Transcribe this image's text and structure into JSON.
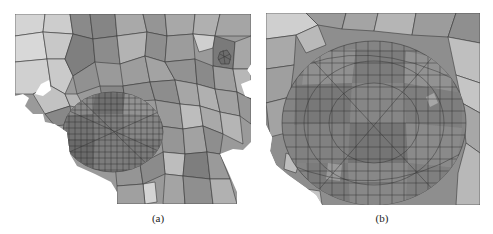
{
  "figure": {
    "panels": [
      {
        "id": "a",
        "caption": "(a)",
        "description": "Grayscale choropleth map of regions with dense urban core at lower-left center and smaller cluster at upper right"
      },
      {
        "id": "b",
        "caption": "(b)",
        "description": "Zoomed-in grayscale choropleth map of the dense urban core showing many small subdivided regions"
      }
    ],
    "palette": {
      "lightest": "#d6d6d6",
      "light": "#b4b4b4",
      "medium": "#9a9a9a",
      "dark": "#858585",
      "darkest": "#6e6e6e",
      "boundary": "#3a3a3a",
      "background": "#ffffff"
    }
  }
}
